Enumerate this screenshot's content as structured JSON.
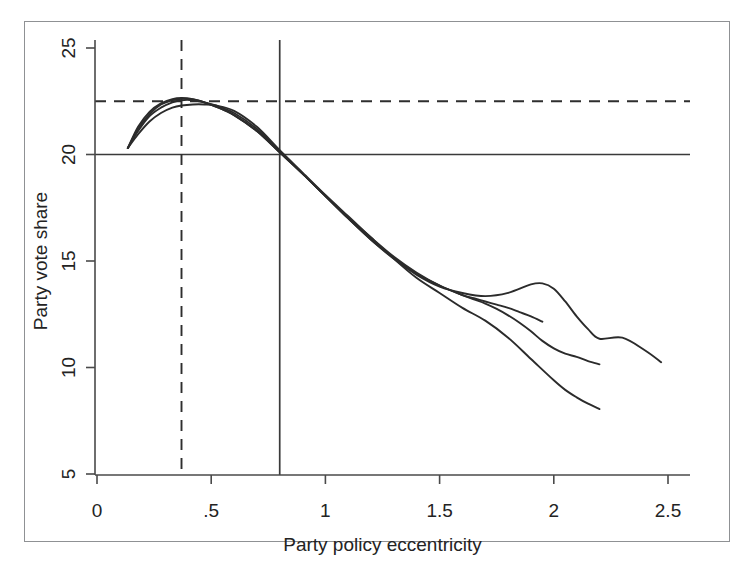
{
  "chart_data": {
    "type": "line",
    "title": "",
    "xlabel": "Party policy eccentricity",
    "ylabel": "Party vote share",
    "xlim": [
      0,
      2.5
    ],
    "ylim": [
      5,
      25
    ],
    "xticks": [
      "0",
      ".5",
      "1",
      "1.5",
      "2",
      "2.5"
    ],
    "xtick_values": [
      0,
      0.5,
      1,
      1.5,
      2,
      2.5
    ],
    "yticks": [
      "5",
      "10",
      "15",
      "20",
      "25"
    ],
    "ytick_values": [
      5,
      10,
      15,
      20,
      25
    ],
    "grid": false,
    "legend": "none",
    "reference_lines": [
      {
        "name": "horizontal-solid-20",
        "orientation": "horizontal",
        "value": 20,
        "style": "solid"
      },
      {
        "name": "horizontal-dashed-22.5",
        "orientation": "horizontal",
        "value": 22.5,
        "style": "dashed"
      },
      {
        "name": "vertical-solid-0.8",
        "orientation": "vertical",
        "value": 0.8,
        "style": "solid"
      },
      {
        "name": "vertical-dashed-0.37",
        "orientation": "vertical",
        "value": 0.37,
        "style": "dashed"
      }
    ],
    "series": [
      {
        "name": "curve-1",
        "x": [
          0.135,
          0.18,
          0.23,
          0.28,
          0.33,
          0.37,
          0.42,
          0.47,
          0.52,
          0.6,
          0.7,
          0.8,
          0.9,
          1.0,
          1.1,
          1.2,
          1.3,
          1.4,
          1.5,
          1.6,
          1.7,
          1.8,
          1.9,
          1.95,
          2.0,
          2.05,
          2.1,
          2.15,
          2.2,
          2.3,
          2.4,
          2.47
        ],
        "y": [
          20.3,
          21.3,
          22.0,
          22.4,
          22.6,
          22.65,
          22.6,
          22.45,
          22.25,
          21.85,
          21.1,
          20.1,
          19.1,
          18.05,
          17.0,
          16.0,
          15.1,
          14.35,
          13.8,
          13.5,
          13.35,
          13.5,
          13.9,
          13.95,
          13.7,
          13.1,
          12.4,
          11.8,
          11.35,
          11.4,
          10.8,
          10.25
        ]
      },
      {
        "name": "curve-2",
        "x": [
          0.135,
          0.18,
          0.23,
          0.28,
          0.33,
          0.37,
          0.42,
          0.47,
          0.52,
          0.6,
          0.7,
          0.8,
          0.9,
          1.0,
          1.1,
          1.2,
          1.3,
          1.4,
          1.5,
          1.6,
          1.65,
          1.7,
          1.75,
          1.8,
          1.85,
          1.9,
          1.95,
          2.0,
          2.05,
          2.1,
          2.15,
          2.2
        ],
        "y": [
          20.3,
          21.2,
          21.9,
          22.35,
          22.55,
          22.62,
          22.58,
          22.45,
          22.25,
          21.85,
          21.1,
          20.1,
          19.1,
          18.05,
          17.0,
          16.0,
          15.15,
          14.4,
          13.85,
          13.4,
          13.2,
          13.0,
          12.75,
          12.45,
          12.1,
          11.7,
          11.25,
          10.9,
          10.65,
          10.5,
          10.3,
          10.15
        ]
      },
      {
        "name": "curve-3",
        "x": [
          0.135,
          0.18,
          0.23,
          0.28,
          0.33,
          0.37,
          0.42,
          0.47,
          0.52,
          0.6,
          0.7,
          0.8,
          0.9,
          1.0,
          1.1,
          1.2,
          1.3,
          1.4,
          1.5,
          1.6,
          1.65,
          1.7,
          1.75,
          1.8,
          1.85,
          1.9,
          1.95
        ],
        "y": [
          20.3,
          21.1,
          21.8,
          22.2,
          22.45,
          22.55,
          22.55,
          22.45,
          22.3,
          21.95,
          21.2,
          20.15,
          19.1,
          18.05,
          17.05,
          16.1,
          15.2,
          14.45,
          13.85,
          13.4,
          13.25,
          13.1,
          12.95,
          12.8,
          12.6,
          12.4,
          12.15
        ]
      },
      {
        "name": "curve-4",
        "x": [
          0.135,
          0.18,
          0.23,
          0.28,
          0.33,
          0.37,
          0.42,
          0.47,
          0.52,
          0.6,
          0.7,
          0.8,
          0.9,
          1.0,
          1.1,
          1.2,
          1.3,
          1.4,
          1.5,
          1.6,
          1.7,
          1.8,
          1.9,
          2.0,
          2.05,
          2.1,
          2.15,
          2.2
        ],
        "y": [
          20.3,
          20.95,
          21.55,
          21.95,
          22.2,
          22.3,
          22.35,
          22.35,
          22.3,
          22.05,
          21.3,
          20.2,
          19.15,
          18.1,
          17.1,
          16.1,
          15.1,
          14.2,
          13.5,
          12.8,
          12.2,
          11.4,
          10.4,
          9.4,
          8.95,
          8.6,
          8.3,
          8.05
        ]
      }
    ]
  }
}
